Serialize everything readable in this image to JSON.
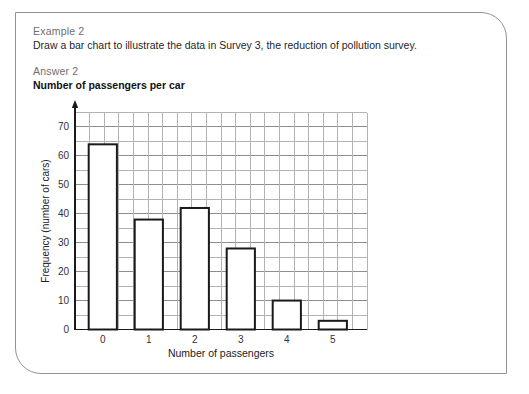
{
  "panel": {
    "example_label": "Example 2",
    "question": "Draw a bar chart to illustrate the data in Survey 3, the reduction of pollution survey.",
    "answer_label": "Answer 2"
  },
  "chart_data": {
    "type": "bar",
    "title": "Number of passengers per car",
    "categories": [
      "0",
      "1",
      "2",
      "3",
      "4",
      "5"
    ],
    "values": [
      64,
      38,
      42,
      28,
      10,
      3
    ],
    "xlabel": "Number of passengers",
    "ylabel": "Frequency (number of cars)",
    "ylim": [
      0,
      75
    ],
    "yticks": [
      0,
      10,
      20,
      30,
      40,
      50,
      60,
      70
    ],
    "grid": "on",
    "grid_minor_step": 5,
    "legend": "none",
    "bar_fill": "#ffffff",
    "bar_stroke": "#1a1a1a",
    "grid_color": "#b3b3b3",
    "grid_major_color": "#8f8f8f",
    "axis_color": "#1a1a1a",
    "tick_label_color": "#333333"
  },
  "colors": {
    "panel_border": "#939393",
    "muted_text": "#6e6e6e",
    "body_text": "#1f1f1f",
    "background": "#ffffff"
  }
}
